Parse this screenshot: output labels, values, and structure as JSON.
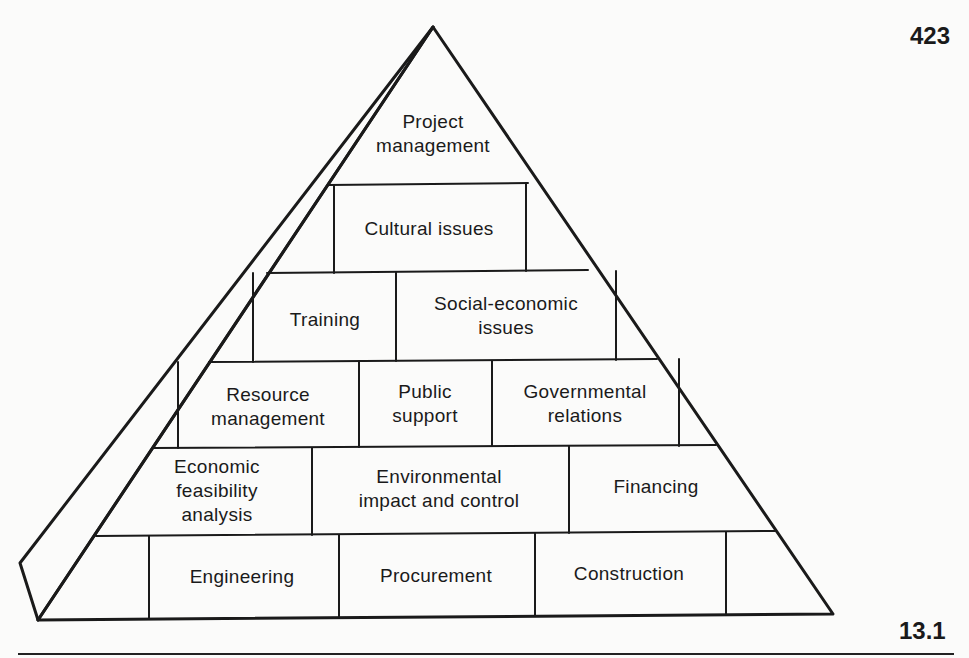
{
  "page": {
    "page_number": "423",
    "figure_number": "13.1"
  },
  "diagram": {
    "type": "pyramid",
    "levels": [
      {
        "level": 1,
        "blocks": [
          {
            "label": "Project\nmanagement"
          }
        ]
      },
      {
        "level": 2,
        "blocks": [
          {
            "label": "Cultural issues"
          }
        ]
      },
      {
        "level": 3,
        "blocks": [
          {
            "label": "Training"
          },
          {
            "label": "Social-economic\nissues"
          }
        ]
      },
      {
        "level": 4,
        "blocks": [
          {
            "label": "Resource\nmanagement"
          },
          {
            "label": "Public\nsupport"
          },
          {
            "label": "Governmental\nrelations"
          }
        ]
      },
      {
        "level": 5,
        "blocks": [
          {
            "label": "Economic\nfeasibility\nanalysis"
          },
          {
            "label": "Environmental\nimpact and control"
          },
          {
            "label": "Financing"
          }
        ]
      },
      {
        "level": 6,
        "blocks": [
          {
            "label": "Engineering"
          },
          {
            "label": "Procurement"
          },
          {
            "label": "Construction"
          }
        ]
      }
    ]
  },
  "colors": {
    "ink": "#1a1a1a",
    "paper": "#fbfbfa"
  }
}
